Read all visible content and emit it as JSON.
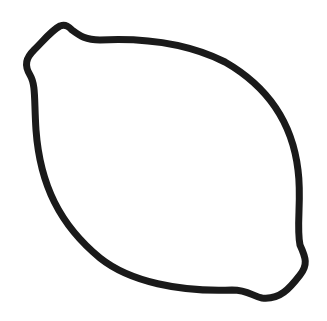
{
  "image": {
    "subject": "lemon-outline",
    "description": "Black line drawing of a lemon-shaped closed outline with small nubs at top-left and bottom-right",
    "stroke_color": "#1a1a1a",
    "background_color": "#ffffff",
    "stroke_width": 7
  }
}
